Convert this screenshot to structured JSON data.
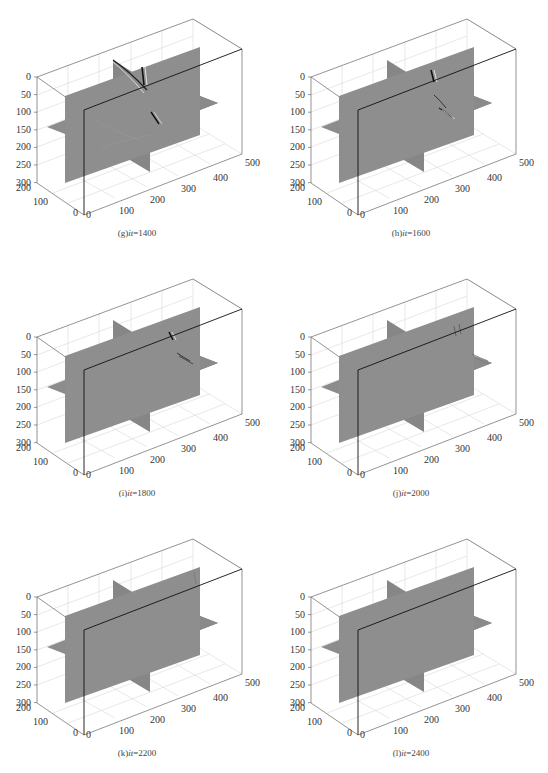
{
  "figure": {
    "panels": [
      {
        "id": "g",
        "label": "(g)",
        "var": "it",
        "sep": "=",
        "value": "1400",
        "wave": "strong"
      },
      {
        "id": "h",
        "label": "(h)",
        "var": "it",
        "sep": "=",
        "value": "1600",
        "wave": "medium"
      },
      {
        "id": "i",
        "label": "(i)",
        "var": "it",
        "sep": "=",
        "value": "1800",
        "wave": "weak"
      },
      {
        "id": "j",
        "label": "(j)",
        "var": "it",
        "sep": "=",
        "value": "2000",
        "wave": "faint"
      },
      {
        "id": "k",
        "label": "(k)",
        "var": "it",
        "sep": "=",
        "value": "2200",
        "wave": "trace"
      },
      {
        "id": "l",
        "label": "(l)",
        "var": "it",
        "sep": "=",
        "value": "2400",
        "wave": "none"
      }
    ],
    "axes": {
      "z_ticks": [
        "0",
        "50",
        "100",
        "150",
        "200",
        "250",
        "300"
      ],
      "y_ticks": [
        "0",
        "100",
        "200"
      ],
      "x_ticks": [
        "0",
        "100",
        "200",
        "300",
        "400",
        "500"
      ]
    },
    "colors": {
      "slice": "#8c8c8c",
      "box": "#555555",
      "grid": "#d8d8d8",
      "edge": "#111111"
    }
  },
  "chart_data": {
    "type": "3d-slice",
    "panels": [
      {
        "caption": "(g)it=1400",
        "time_step": 1400
      },
      {
        "caption": "(h)it=1600",
        "time_step": 1600
      },
      {
        "caption": "(i)it=1800",
        "time_step": 1800
      },
      {
        "caption": "(j)it=2000",
        "time_step": 2000
      },
      {
        "caption": "(k)it=2200",
        "time_step": 2200
      },
      {
        "caption": "(l)it=2400",
        "time_step": 2400
      }
    ],
    "axes": {
      "z": {
        "ticks": [
          0,
          50,
          100,
          150,
          200,
          250,
          300
        ],
        "range": [
          0,
          300
        ],
        "reversed": true
      },
      "y": {
        "ticks": [
          0,
          100,
          200
        ],
        "range": [
          0,
          200
        ]
      },
      "x": {
        "ticks": [
          0,
          100,
          200,
          300,
          400,
          500
        ],
        "range": [
          0,
          500
        ]
      }
    },
    "slices": [
      "vertical x-z plane",
      "horizontal x-y plane at z≈150",
      "vertical y-z plane"
    ],
    "grid": true,
    "layout": {
      "rows": 3,
      "cols": 2
    }
  }
}
